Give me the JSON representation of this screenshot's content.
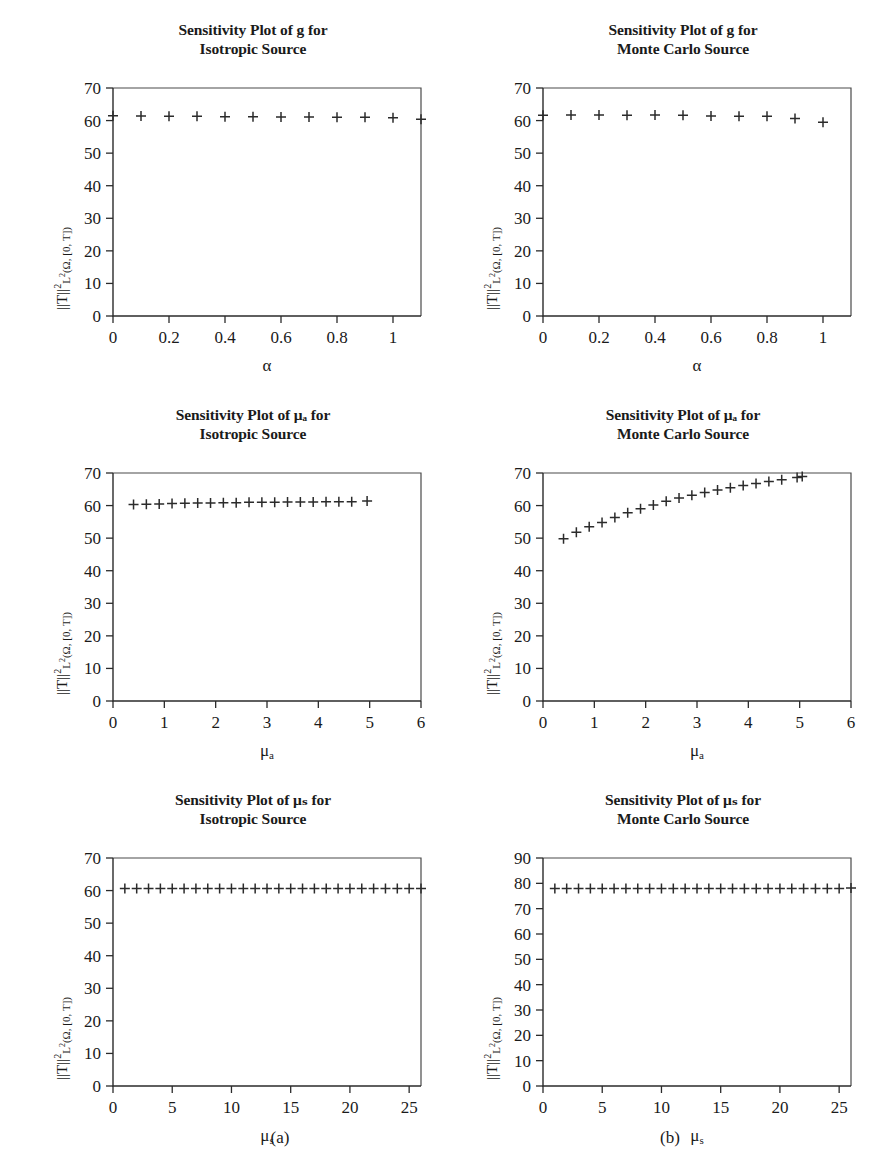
{
  "figure": {
    "panel_letters": [
      {
        "label": "(a)",
        "x": 250,
        "y": 1128
      },
      {
        "label": "(b)",
        "x": 640,
        "y": 1128
      }
    ]
  },
  "chart_data": [
    {
      "id": "g-isotropic",
      "type": "scatter",
      "title_line1": "Sensitivity Plot of g for",
      "title_line2": "Isotropic Source",
      "xlabel": "α",
      "xlabel_sub": "",
      "ylabel_main": "||T||",
      "ylabel_sup": "2",
      "ylabel_sub": "L",
      "ylabel_sub_sup": "2",
      "ylabel_tail": "(Ω, [0, T])",
      "xlim": [
        0,
        1.1
      ],
      "ylim": [
        0,
        70
      ],
      "xticks": [
        0,
        0.2,
        0.4,
        0.6,
        0.8,
        1
      ],
      "xticklabels": [
        "0",
        "0.2",
        "0.4",
        "0.6",
        "0.8",
        "1"
      ],
      "yticks": [
        0,
        10,
        20,
        30,
        40,
        50,
        60,
        70
      ],
      "yticklabels": [
        "0",
        "10",
        "20",
        "30",
        "40",
        "50",
        "60",
        "70"
      ],
      "grid": false,
      "marker": "+",
      "x": [
        0.0,
        0.1,
        0.2,
        0.3,
        0.4,
        0.5,
        0.6,
        0.7,
        0.8,
        0.9,
        1.0,
        1.1
      ],
      "y": [
        61.5,
        61.4,
        61.3,
        61.3,
        61.2,
        61.2,
        61.1,
        61.1,
        61.0,
        61.0,
        60.9,
        60.4
      ]
    },
    {
      "id": "g-montecarlo",
      "type": "scatter",
      "title_line1": "Sensitivity Plot of g for",
      "title_line2": "Monte Carlo Source",
      "xlabel": "α",
      "xlabel_sub": "",
      "ylabel_main": "||T||",
      "ylabel_sup": "2",
      "ylabel_sub": "L",
      "ylabel_sub_sup": "2",
      "ylabel_tail": "(Ω, [0, T])",
      "xlim": [
        0,
        1.1
      ],
      "ylim": [
        0,
        70
      ],
      "xticks": [
        0,
        0.2,
        0.4,
        0.6,
        0.8,
        1
      ],
      "xticklabels": [
        "0",
        "0.2",
        "0.4",
        "0.6",
        "0.8",
        "1"
      ],
      "yticks": [
        0,
        10,
        20,
        30,
        40,
        50,
        60,
        70
      ],
      "yticklabels": [
        "0",
        "10",
        "20",
        "30",
        "40",
        "50",
        "60",
        "70"
      ],
      "grid": false,
      "marker": "+",
      "x": [
        0.0,
        0.1,
        0.2,
        0.3,
        0.4,
        0.5,
        0.6,
        0.7,
        0.8,
        0.9,
        1.0
      ],
      "y": [
        61.6,
        61.7,
        61.7,
        61.6,
        61.7,
        61.6,
        61.4,
        61.3,
        61.3,
        60.6,
        59.5
      ]
    },
    {
      "id": "mua-isotropic",
      "type": "scatter",
      "title_line1": "Sensitivity Plot of μₐ for",
      "title_line2": "Isotropic Source",
      "xlabel": "μ",
      "xlabel_sub": "a",
      "ylabel_main": "||T||",
      "ylabel_sup": "2",
      "ylabel_sub": "L",
      "ylabel_sub_sup": "2",
      "ylabel_tail": "(Ω, [0, T])",
      "xlim": [
        0,
        6
      ],
      "ylim": [
        0,
        70
      ],
      "xticks": [
        0,
        1,
        2,
        3,
        4,
        5,
        6
      ],
      "xticklabels": [
        "0",
        "1",
        "2",
        "3",
        "4",
        "5",
        "6"
      ],
      "yticks": [
        0,
        10,
        20,
        30,
        40,
        50,
        60,
        70
      ],
      "yticklabels": [
        "0",
        "10",
        "20",
        "30",
        "40",
        "50",
        "60",
        "70"
      ],
      "grid": false,
      "marker": "+",
      "x": [
        0.4,
        0.65,
        0.9,
        1.15,
        1.4,
        1.65,
        1.9,
        2.15,
        2.4,
        2.65,
        2.9,
        3.15,
        3.4,
        3.65,
        3.9,
        4.15,
        4.4,
        4.65,
        4.95
      ],
      "y": [
        60.3,
        60.4,
        60.5,
        60.6,
        60.7,
        60.8,
        60.8,
        60.9,
        60.9,
        61.0,
        61.0,
        61.0,
        61.1,
        61.1,
        61.1,
        61.2,
        61.2,
        61.2,
        61.4
      ]
    },
    {
      "id": "mua-montecarlo",
      "type": "scatter",
      "title_line1": "Sensitivity Plot of μₐ for",
      "title_line2": "Monte Carlo Source",
      "xlabel": "μ",
      "xlabel_sub": "a",
      "ylabel_main": "||T||",
      "ylabel_sup": "2",
      "ylabel_sub": "L",
      "ylabel_sub_sup": "2",
      "ylabel_tail": "(Ω, [0, T])",
      "xlim": [
        0,
        6
      ],
      "ylim": [
        0,
        70
      ],
      "xticks": [
        0,
        1,
        2,
        3,
        4,
        5,
        6
      ],
      "xticklabels": [
        "0",
        "1",
        "2",
        "3",
        "4",
        "5",
        "6"
      ],
      "yticks": [
        0,
        10,
        20,
        30,
        40,
        50,
        60,
        70
      ],
      "yticklabels": [
        "0",
        "10",
        "20",
        "30",
        "40",
        "50",
        "60",
        "70"
      ],
      "grid": false,
      "marker": "+",
      "x": [
        0.4,
        0.65,
        0.9,
        1.15,
        1.4,
        1.65,
        1.9,
        2.15,
        2.4,
        2.65,
        2.9,
        3.15,
        3.4,
        3.65,
        3.9,
        4.15,
        4.4,
        4.65,
        4.95,
        5.05
      ],
      "y": [
        49.8,
        51.8,
        53.5,
        54.8,
        56.3,
        57.8,
        59.0,
        60.2,
        61.3,
        62.3,
        63.2,
        64.0,
        64.8,
        65.5,
        66.2,
        66.8,
        67.4,
        67.9,
        68.6,
        68.9
      ]
    },
    {
      "id": "mus-isotropic",
      "type": "scatter",
      "title_line1": "Sensitivity Plot of μₛ for",
      "title_line2": "Isotropic Source",
      "xlabel": "μ",
      "xlabel_sub": "s",
      "ylabel_main": "||T||",
      "ylabel_sup": "2",
      "ylabel_sub": "L",
      "ylabel_sub_sup": "2",
      "ylabel_tail": "(Ω, [0, T])",
      "xlim": [
        0,
        26
      ],
      "ylim": [
        0,
        70
      ],
      "xticks": [
        0,
        5,
        10,
        15,
        20,
        25
      ],
      "xticklabels": [
        "0",
        "5",
        "10",
        "15",
        "20",
        "25"
      ],
      "yticks": [
        0,
        10,
        20,
        30,
        40,
        50,
        60,
        70
      ],
      "yticklabels": [
        "0",
        "10",
        "20",
        "30",
        "40",
        "50",
        "60",
        "70"
      ],
      "grid": false,
      "marker": "+",
      "x": [
        1,
        2,
        3,
        4,
        5,
        6,
        7,
        8,
        9,
        10,
        11,
        12,
        13,
        14,
        15,
        16,
        17,
        18,
        19,
        20,
        21,
        22,
        23,
        24,
        25,
        26
      ],
      "y": [
        60.6,
        60.6,
        60.6,
        60.6,
        60.6,
        60.6,
        60.6,
        60.6,
        60.6,
        60.6,
        60.6,
        60.6,
        60.6,
        60.6,
        60.6,
        60.6,
        60.6,
        60.6,
        60.6,
        60.6,
        60.6,
        60.6,
        60.6,
        60.6,
        60.6,
        60.6
      ]
    },
    {
      "id": "mus-montecarlo",
      "type": "scatter",
      "title_line1": "Sensitivity Plot of μₛ for",
      "title_line2": "Monte Carlo Source",
      "xlabel": "μ",
      "xlabel_sub": "s",
      "ylabel_main": "||T||",
      "ylabel_sup": "2",
      "ylabel_sub": "L",
      "ylabel_sub_sup": "2",
      "ylabel_tail": "(Ω, [0, T])",
      "xlim": [
        0,
        26
      ],
      "ylim": [
        0,
        90
      ],
      "xticks": [
        0,
        5,
        10,
        15,
        20,
        25
      ],
      "xticklabels": [
        "0",
        "5",
        "10",
        "15",
        "20",
        "25"
      ],
      "yticks": [
        0,
        10,
        20,
        30,
        40,
        50,
        60,
        70,
        80,
        90
      ],
      "yticklabels": [
        "0",
        "10",
        "20",
        "30",
        "40",
        "50",
        "60",
        "70",
        "80",
        "90"
      ],
      "grid": false,
      "marker": "+",
      "x": [
        1,
        2,
        3,
        4,
        5,
        6,
        7,
        8,
        9,
        10,
        11,
        12,
        13,
        14,
        15,
        16,
        17,
        18,
        19,
        20,
        21,
        22,
        23,
        24,
        25,
        26
      ],
      "y": [
        78.0,
        78.0,
        78.0,
        78.0,
        78.0,
        78.0,
        78.0,
        78.0,
        78.0,
        78.0,
        78.0,
        78.0,
        78.0,
        78.0,
        78.0,
        78.0,
        78.0,
        78.0,
        78.0,
        78.0,
        78.0,
        78.0,
        78.0,
        78.0,
        78.0,
        78.2
      ]
    }
  ]
}
